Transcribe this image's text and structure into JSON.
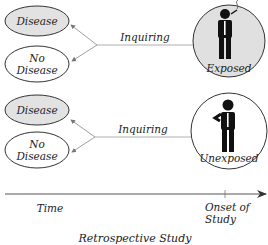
{
  "diagram": {
    "title": "Retrospective Study",
    "groups": [
      {
        "outcomes": [
          {
            "label": "Disease",
            "fill": "#e2e2e2"
          },
          {
            "label_line1": "No",
            "label_line2": "Disease",
            "fill": "#ffffff"
          }
        ],
        "arrow_label": "Inquiring",
        "exposure": {
          "label": "Exposed",
          "fill": "#e0e0e0",
          "icon": "smoking-person-icon"
        }
      },
      {
        "outcomes": [
          {
            "label": "Disease",
            "fill": "#e2e2e2"
          },
          {
            "label_line1": "No",
            "label_line2": "Disease",
            "fill": "#ffffff"
          }
        ],
        "arrow_label": "Inquiring",
        "exposure": {
          "label": "Unexposed",
          "fill": "#ffffff",
          "icon": "non-smoking-person-icon"
        }
      }
    ],
    "timeline": {
      "start_label": "Time",
      "marker_label_line1": "Onset of",
      "marker_label_line2": "Study"
    }
  }
}
